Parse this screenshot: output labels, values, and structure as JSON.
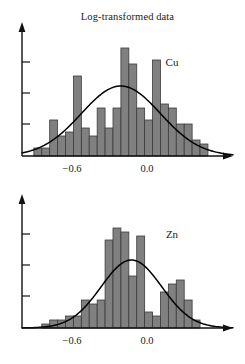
{
  "figure": {
    "title": "Log-transformed data",
    "background_color": "#ffffff",
    "bar_color": "#808080",
    "bar_edge_color": "#3b3b3b",
    "curve_color": "#000000",
    "axis_color": "#111111"
  },
  "chart_data": [
    {
      "type": "bar",
      "title": "Log-transformed data",
      "series_label": "Cu",
      "xlabel": "",
      "ylabel": "",
      "xlim": [
        -1.05,
        0.55
      ],
      "ylim": [
        0,
        30
      ],
      "grid": false,
      "legend_position": "inside-top-right",
      "xticks": [
        -0.6,
        0.0
      ],
      "xtick_labels": [
        "−0.6",
        "0.0"
      ],
      "ytick_count": 3,
      "bin_width": 0.06,
      "bin_left_edges": [
        -0.96,
        -0.9,
        -0.84,
        -0.78,
        -0.72,
        -0.66,
        -0.6,
        -0.54,
        -0.48,
        -0.42,
        -0.36,
        -0.3,
        -0.24,
        -0.18,
        -0.12,
        -0.06,
        0.0,
        0.06,
        0.12,
        0.18,
        0.24,
        0.3
      ],
      "values": [
        2,
        2,
        9,
        5,
        6,
        20,
        7,
        5,
        12,
        7,
        12,
        27,
        23,
        12,
        9,
        24,
        13,
        12,
        8,
        8,
        4,
        3
      ],
      "curve": {
        "type": "normal-density-overlay",
        "mean": -0.3,
        "sd": 0.3,
        "peak_value": 17.5
      },
      "annotations": [
        {
          "text": "Cu",
          "x": 0.16,
          "y": 26
        }
      ]
    },
    {
      "type": "bar",
      "title": "",
      "series_label": "Zn",
      "xlabel": "",
      "ylabel": "",
      "xlim": [
        -1.05,
        0.55
      ],
      "ylim": [
        0,
        30
      ],
      "grid": false,
      "legend_position": "inside-top-right",
      "xticks": [
        -0.6,
        0.0
      ],
      "xtick_labels": [
        "−0.6",
        "0.0"
      ],
      "ytick_count": 3,
      "bin_width": 0.06,
      "bin_left_edges": [
        -0.9,
        -0.84,
        -0.78,
        -0.72,
        -0.66,
        -0.6,
        -0.54,
        -0.48,
        -0.42,
        -0.36,
        -0.3,
        -0.24,
        -0.18,
        -0.12,
        -0.06,
        0.0,
        0.06,
        0.12,
        0.18,
        0.24
      ],
      "values": [
        1,
        2,
        2,
        3,
        3,
        7,
        6,
        7,
        22,
        25,
        24,
        13,
        23,
        4,
        3,
        9,
        11,
        12,
        7,
        2
      ],
      "curve": {
        "type": "normal-density-overlay",
        "mean": -0.22,
        "sd": 0.23,
        "peak_value": 17
      },
      "annotations": [
        {
          "text": "Zn",
          "x": 0.14,
          "y": 25
        }
      ]
    }
  ]
}
